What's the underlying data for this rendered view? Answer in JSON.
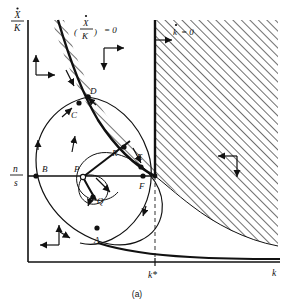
{
  "figure": {
    "caption": "(a)",
    "type": "phase-diagram"
  },
  "axes": {
    "y_label_numerator": "X",
    "y_label_denominator": "K",
    "y_label_dot": true,
    "x_label": "k",
    "y_tick_numerator": "n",
    "y_tick_denominator": "s",
    "x_tick_label": "k*"
  },
  "nullclines": [
    {
      "id": "xk-nullcline",
      "numerator": "X",
      "denominator": "K",
      "dot": true,
      "paren_open": "(",
      "paren_close": ")",
      "equals": ") = 0",
      "equals_plain": "= 0",
      "description": "downward sloping (X-dot/K)=0 locus"
    },
    {
      "id": "k-nullcline",
      "symbol": "k",
      "dot": true,
      "equals_plain": "= 0",
      "description": "vertical k-dot = 0 locus at k*"
    }
  ],
  "labels": {
    "xk_nullcline_text": "= 0",
    "k_nullcline_symbol": "k",
    "k_nullcline_text": "= 0"
  },
  "points": [
    {
      "id": "A",
      "label": "A",
      "x": 97,
      "y": 228,
      "style": "filled"
    },
    {
      "id": "B",
      "label": "B",
      "x": 43,
      "y": 168,
      "style": "filled"
    },
    {
      "id": "C",
      "label": "C",
      "x": 79,
      "y": 110,
      "style": "filled"
    },
    {
      "id": "D",
      "label": "D",
      "x": 88,
      "y": 97,
      "style": "filled"
    },
    {
      "id": "E",
      "label": "E",
      "x": 141,
      "y": 166,
      "style": "filled"
    },
    {
      "id": "F",
      "label": "F",
      "x": 155,
      "y": 176,
      "style": "filled"
    },
    {
      "id": "P",
      "label": "P",
      "x": 83,
      "y": 176,
      "style": "open"
    },
    {
      "id": "Q",
      "label": "Q",
      "x": 95,
      "y": 197,
      "style": "filled"
    },
    {
      "id": "R",
      "label": "R",
      "x": 119,
      "y": 155,
      "style": "filled"
    }
  ],
  "direction_markers": [
    {
      "id": "upper-left",
      "horizontal": "right",
      "vertical": "up"
    },
    {
      "id": "upper-middle",
      "horizontal": "right",
      "vertical": "down"
    },
    {
      "id": "right",
      "horizontal": "left",
      "vertical": "down"
    },
    {
      "id": "lower-left",
      "horizontal": "left",
      "vertical": "up"
    }
  ],
  "regions": [
    {
      "id": "hatched-right",
      "fill": "diagonal-hatch",
      "description": "hatched region right of k-dot=0 nullcline"
    },
    {
      "id": "hatched-band",
      "fill": "diagonal-hatch",
      "description": "hatched band left of the (X-dot/K)=0 nullcline"
    }
  ],
  "colors": {
    "stroke": "#111111",
    "background": "#ffffff",
    "hatch": "#222222",
    "dashed": "#555555"
  }
}
